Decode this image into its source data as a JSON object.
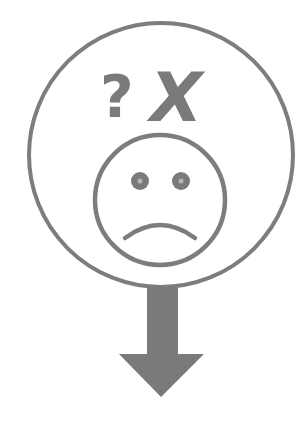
{
  "illustration": {
    "description": "Sad face inside circle with question mark and X, arrow pointing down",
    "symbols": {
      "question_mark": "?",
      "x_mark": "X"
    },
    "icons": [
      "sad-face-icon",
      "question-mark-icon",
      "x-mark-icon",
      "down-arrow-icon"
    ],
    "colors": {
      "stroke": "#7d7d7d",
      "fill": "#7a7a7a",
      "background": "#ffffff"
    }
  }
}
